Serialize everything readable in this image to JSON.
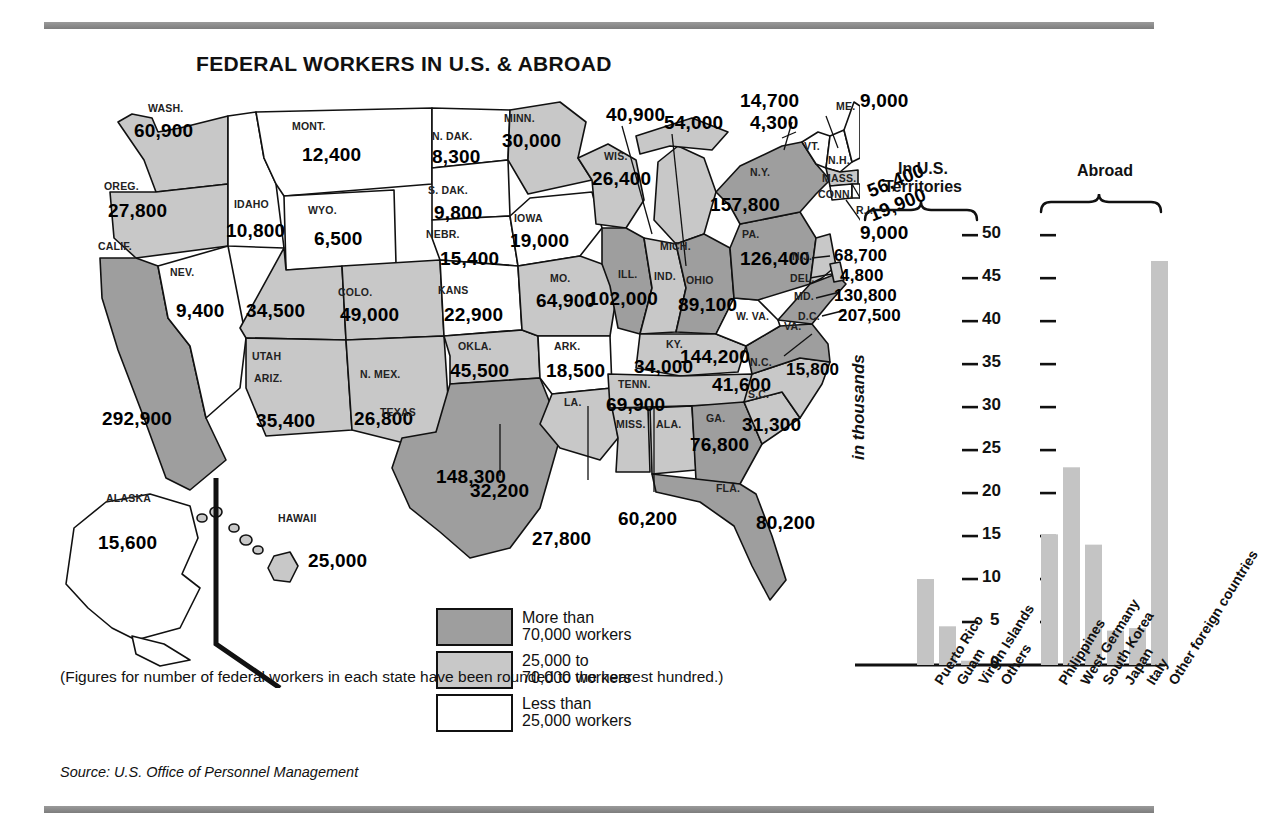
{
  "title": "FEDERAL WORKERS IN U.S. & ABROAD",
  "note": "(Figures for number of federal workers in each state have been rounded to the nearest hundred.)",
  "source": "Source: U.S. Office of Personnel Management",
  "colors": {
    "high": "#9e9e9e",
    "mid": "#c8c8c8",
    "low": "#ffffff",
    "outline": "#111111",
    "bar": "#c4c4c4",
    "rule": "#8a8a8a"
  },
  "legend": [
    {
      "swatch": "high",
      "line1": "More than",
      "line2": "70,000 workers"
    },
    {
      "swatch": "mid",
      "line1": "25,000 to",
      "line2": "70,000 workers"
    },
    {
      "swatch": "low",
      "line1": "Less than",
      "line2": "25,000 workers"
    }
  ],
  "states": [
    {
      "abbr": "WASH.",
      "value": "60,900",
      "tier": "mid"
    },
    {
      "abbr": "OREG.",
      "value": "27,800",
      "tier": "mid"
    },
    {
      "abbr": "CALIF.",
      "value": "292,900",
      "tier": "high"
    },
    {
      "abbr": "NEV.",
      "value": "9,400",
      "tier": "low"
    },
    {
      "abbr": "IDAHO",
      "value": "10,800",
      "tier": "low"
    },
    {
      "abbr": "MONT.",
      "value": "12,400",
      "tier": "low"
    },
    {
      "abbr": "WYO.",
      "value": "6,500",
      "tier": "low"
    },
    {
      "abbr": "UTAH",
      "value": "34,500",
      "tier": "mid"
    },
    {
      "abbr": "COLO.",
      "value": "49,000",
      "tier": "mid"
    },
    {
      "abbr": "ARIZ.",
      "value": "35,400",
      "tier": "mid"
    },
    {
      "abbr": "N. MEX.",
      "value": "26,800",
      "tier": "mid"
    },
    {
      "abbr": "N. DAK.",
      "value": "8,300",
      "tier": "low"
    },
    {
      "abbr": "S. DAK.",
      "value": "9,800",
      "tier": "low"
    },
    {
      "abbr": "NEBR.",
      "value": "15,400",
      "tier": "low"
    },
    {
      "abbr": "KANS",
      "value": "22,900",
      "tier": "low"
    },
    {
      "abbr": "OKLA.",
      "value": "45,500",
      "tier": "mid"
    },
    {
      "abbr": "TEXAS",
      "value": "148,300",
      "tier": "high"
    },
    {
      "abbr": "MINN.",
      "value": "30,000",
      "tier": "mid"
    },
    {
      "abbr": "IOWA",
      "value": "19,000",
      "tier": "low"
    },
    {
      "abbr": "MO.",
      "value": "64,900",
      "tier": "mid"
    },
    {
      "abbr": "ARK.",
      "value": "18,500",
      "tier": "low"
    },
    {
      "abbr": "LA.",
      "value": "32,200",
      "tier": "mid"
    },
    {
      "abbr": "WIS.",
      "value": "26,400",
      "tier": "mid"
    },
    {
      "abbr": "ILL.",
      "value": "102,000",
      "tier": "high"
    },
    {
      "abbr": "MICH.",
      "value": "54,000",
      "tier": "mid"
    },
    {
      "abbr": "IND.",
      "value": "40,900",
      "tier": "mid"
    },
    {
      "abbr": "OHIO",
      "value": "89,100",
      "tier": "high"
    },
    {
      "abbr": "KY.",
      "value": "34,000",
      "tier": "mid"
    },
    {
      "abbr": "TENN.",
      "value": "69,900",
      "tier": "mid"
    },
    {
      "abbr": "MISS.",
      "value": "27,800",
      "tier": "mid"
    },
    {
      "abbr": "ALA.",
      "value": "60,200",
      "tier": "mid"
    },
    {
      "abbr": "GA.",
      "value": "76,800",
      "tier": "high"
    },
    {
      "abbr": "FLA.",
      "value": "80,200",
      "tier": "high"
    },
    {
      "abbr": "S.C.",
      "value": "31,300",
      "tier": "mid"
    },
    {
      "abbr": "N.C.",
      "value": "41,600",
      "tier": "mid"
    },
    {
      "abbr": "VA.",
      "value": "144,200",
      "tier": "high"
    },
    {
      "abbr": "W. VA.",
      "value": "15,800",
      "tier": "low"
    },
    {
      "abbr": "PA.",
      "value": "126,400",
      "tier": "high"
    },
    {
      "abbr": "N.Y.",
      "value": "157,800",
      "tier": "high"
    },
    {
      "abbr": "N.J.",
      "value": "68,700",
      "tier": "mid"
    },
    {
      "abbr": "DEL.",
      "value": "4,800",
      "tier": "low"
    },
    {
      "abbr": "MD.",
      "value": "130,800",
      "tier": "high"
    },
    {
      "abbr": "D.C.",
      "value": "207,500",
      "tier": "high"
    },
    {
      "abbr": "VT.",
      "value": "4,300",
      "tier": "low"
    },
    {
      "abbr": "N.H.",
      "value": "14,700",
      "tier": "low"
    },
    {
      "abbr": "ME.",
      "value": "9,000",
      "tier": "low"
    },
    {
      "abbr": "MASS.",
      "value": "56,400",
      "tier": "mid"
    },
    {
      "abbr": "CONN.",
      "value": "19,900",
      "tier": "low"
    },
    {
      "abbr": "R.I.",
      "value": "9,000",
      "tier": "low"
    },
    {
      "abbr": "ALASKA",
      "value": "15,600",
      "tier": "low"
    },
    {
      "abbr": "HAWAII",
      "value": "25,000",
      "tier": "mid"
    }
  ],
  "chart_data": {
    "type": "bar",
    "title": "",
    "ylabel": "in thousands",
    "xlabel": "",
    "ylim": [
      0,
      52
    ],
    "yticks": [
      0,
      5,
      10,
      15,
      20,
      25,
      30,
      35,
      40,
      45,
      50
    ],
    "grid": false,
    "legend_position": "none",
    "groups": [
      {
        "name": "In U.S. Territories",
        "categories": [
          "Puerto Rico",
          "Guam",
          "Virgin Islands",
          "Others"
        ],
        "values": [
          10,
          4.5,
          0.5,
          0
        ]
      },
      {
        "name": "Abroad",
        "categories": [
          "Philippines",
          "West Germany",
          "South Korea",
          "Japan",
          "Italy",
          "Other foreign countries"
        ],
        "values": [
          15.2,
          23,
          14,
          4,
          4.3,
          47
        ]
      }
    ],
    "categories": [
      "Puerto Rico",
      "Guam",
      "Virgin Islands",
      "Others",
      "Philippines",
      "West Germany",
      "South Korea",
      "Japan",
      "Italy",
      "Other foreign countries"
    ],
    "values": [
      10,
      4.5,
      0.5,
      0,
      15.2,
      23,
      14,
      4,
      4.3,
      47
    ]
  }
}
